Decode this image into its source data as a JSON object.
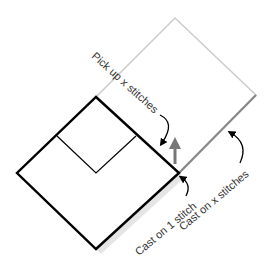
{
  "diagram": {
    "labels": {
      "pick_up": "Pick up x stitches",
      "cast_on_one": "Cast on 1 stitch",
      "cast_on_x": "Cast on x stitches"
    },
    "colors": {
      "worked_square": "#000000",
      "new_square": "#c8c8c8",
      "new_square_shadow": "#888888",
      "direction_arrow": "#777777",
      "callout_arrow": "#000000",
      "text": "#333333"
    },
    "icons": {
      "direction": "up-arrow-icon",
      "callout": "curved-arrow-icon"
    }
  }
}
